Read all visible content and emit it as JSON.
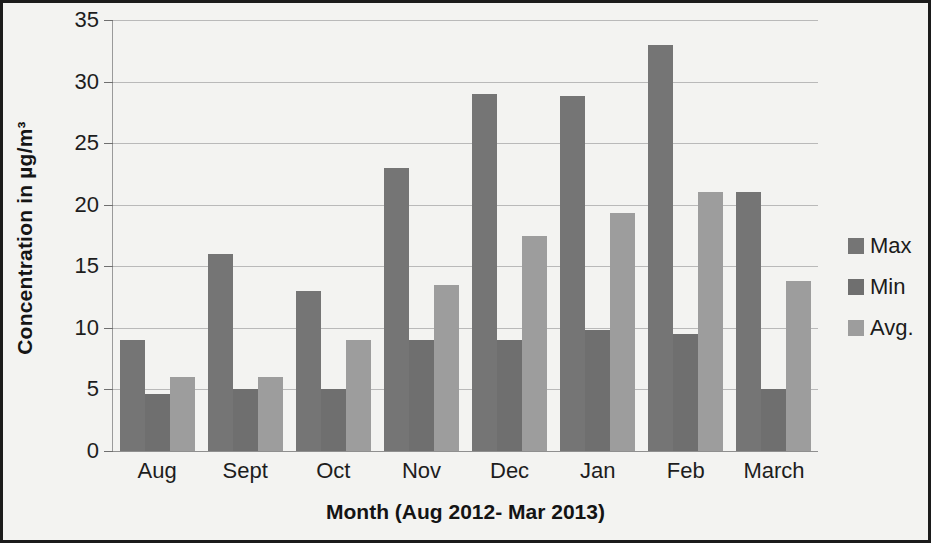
{
  "chart_data": {
    "type": "bar",
    "title": "",
    "xlabel": "Month (Aug 2012- Mar 2013)",
    "ylabel": "Concentration in µg/m³",
    "categories": [
      "Aug",
      "Sept",
      "Oct",
      "Nov",
      "Dec",
      "Jan",
      "Feb",
      "March"
    ],
    "series": [
      {
        "name": "Max",
        "color": "#757575",
        "values": [
          9,
          16,
          13,
          23,
          29,
          28.8,
          33,
          21
        ]
      },
      {
        "name": "Min",
        "color": "#6f6f6f",
        "values": [
          4.6,
          5,
          5,
          9,
          9,
          9.8,
          9.5,
          5
        ]
      },
      {
        "name": "Avg.",
        "color": "#9d9d9d",
        "values": [
          6,
          6,
          9,
          13.5,
          17.5,
          19.3,
          21,
          13.8
        ]
      }
    ],
    "ylim": [
      0,
      35
    ],
    "yticks": [
      0,
      5,
      10,
      15,
      20,
      25,
      30,
      35
    ],
    "ytick_labels": [
      "0",
      "5",
      "10",
      "15",
      "20",
      "25",
      "30",
      "35"
    ],
    "grid": true,
    "legend_position": "right",
    "legend_entries": [
      "Max",
      "Min",
      "Avg."
    ]
  },
  "frame": {
    "border_color": "#1b1b1b",
    "background": "#f3f3f1"
  }
}
